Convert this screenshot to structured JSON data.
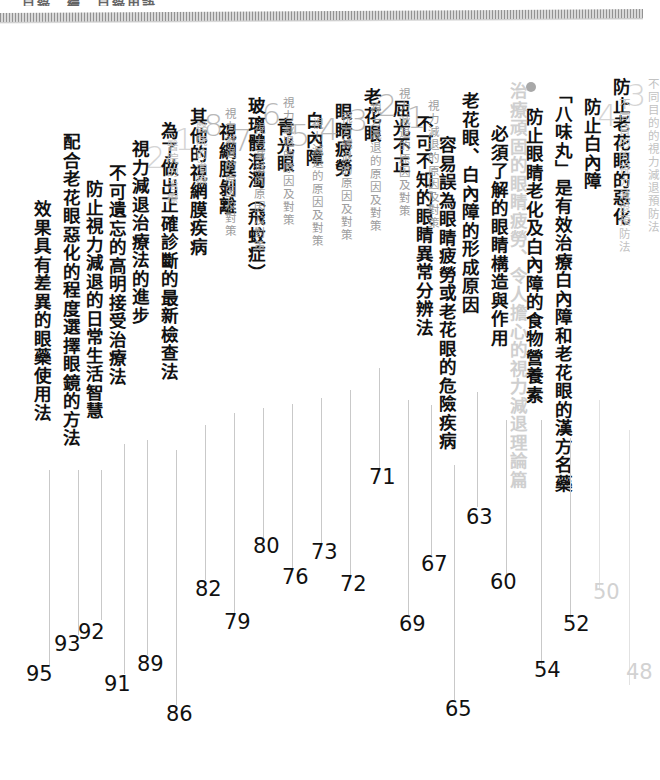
{
  "page": {
    "type": "book-table-of-contents",
    "language": "zh-Hant",
    "orientation": "vertical-rl",
    "top_cropped_text": "目錄　續　目錄用語",
    "colors": {
      "title_black": "#111111",
      "kicker_gray": "#9d9d9d",
      "number_gray": "#b9b9b9",
      "faded_gray": "#cfcfcf",
      "leader_line": "#c9c9c9"
    }
  },
  "entries": [
    {
      "id": "e01",
      "kicker": "",
      "number": "",
      "title": "效果具有差異的眼藥使用法",
      "page": "95",
      "faded": false
    },
    {
      "id": "e02",
      "kicker": "",
      "number": "",
      "title": "配合老花眼惡化的程度選擇眼鏡的方法",
      "page": "93",
      "faded": false
    },
    {
      "id": "e03",
      "kicker": "",
      "number": "",
      "title": "防止視力減退的日常生活智慧",
      "page": "92",
      "faded": false
    },
    {
      "id": "e04",
      "kicker": "",
      "number": "",
      "title": "不可遺忘的高明接受治療法",
      "page": "91",
      "faded": false
    },
    {
      "id": "e05",
      "kicker": "醫院的治療",
      "number": "2",
      "title": "視力減退治療法的進步",
      "page": "89",
      "faded": true
    },
    {
      "id": "e06",
      "kicker": "醫院的治療",
      "number": "1",
      "title": "為了做出正確診斷的最新檢查法",
      "page": "86",
      "faded": true
    },
    {
      "id": "e07",
      "kicker": "視力減退的原因及對策",
      "number": "8",
      "title": "其他的視網膜疾病",
      "page": "82",
      "faded": false
    },
    {
      "id": "e08",
      "kicker": "視力減退的原因及對策",
      "number": "7",
      "title": "視網膜剝離",
      "page": "79",
      "faded": false
    },
    {
      "id": "e09",
      "kicker": "視力減退的原因及對策",
      "number": "6",
      "title": "玻璃體混濁（飛蚊症）",
      "page": "76",
      "faded": false
    },
    {
      "id": "e10",
      "kicker": "視力減退的原因及對策",
      "number": "5",
      "title": "青光眼",
      "page": "80",
      "faded": false
    },
    {
      "id": "e11",
      "kicker": "視力減退的原因及對策",
      "number": "4",
      "title": "白內障",
      "page": "73",
      "faded": false
    },
    {
      "id": "e12",
      "kicker": "視力減退的原因及對策",
      "number": "3",
      "title": "眼睛疲勞",
      "page": "72",
      "faded": false
    },
    {
      "id": "e13",
      "kicker": "視力減退的原因及對策",
      "number": "2",
      "title": "老花眼",
      "page": "71",
      "faded": false
    },
    {
      "id": "e14",
      "kicker": "視力減退的原因及對策",
      "number": "1",
      "title": "屈光不正",
      "page": "69",
      "faded": false
    },
    {
      "id": "e15",
      "kicker": "",
      "number": "",
      "title": "不可不知的眼睛異常分辨法",
      "page": "67",
      "faded": false
    },
    {
      "id": "e16",
      "kicker": "",
      "number": "",
      "title": "容易誤為眼睛疲勞或老花眼的危險疾病",
      "page": "65",
      "faded": false
    },
    {
      "id": "e17",
      "kicker": "",
      "number": "",
      "title": "老花眼、白內障的形成原因",
      "page": "63",
      "faded": false
    },
    {
      "id": "e18",
      "kicker": "",
      "number": "",
      "title": "必須了解的眼睛構造與作用",
      "page": "60",
      "faded": false
    },
    {
      "id": "e19",
      "kicker": "",
      "number": "",
      "bullet": true,
      "title": "治療頑固的眼睛疲勞、令人擔心的視力減退理論篇",
      "page": "",
      "faded": true
    },
    {
      "id": "e20",
      "kicker": "",
      "number": "",
      "title": "防止眼睛老化及白內障的食物營養素",
      "page": "54",
      "faded": false
    },
    {
      "id": "e21",
      "kicker": "",
      "number": "",
      "title": "「八味丸」是有效治療白內障和老花眼的漢方名藥",
      "page": "52",
      "faded": false
    },
    {
      "id": "e22",
      "kicker": "不同目的的視力減退預防法",
      "number": "4",
      "title": "防止白內障",
      "page": "50",
      "faded": true
    },
    {
      "id": "e23",
      "kicker": "不同目的的視力減退預防法",
      "number": "3",
      "title": "防止老花眼的惡化",
      "page": "48",
      "faded": true
    }
  ],
  "page_numbers": [
    {
      "value": "95",
      "faded": false
    },
    {
      "value": "93",
      "faded": false
    },
    {
      "value": "92",
      "faded": false
    },
    {
      "value": "91",
      "faded": false
    },
    {
      "value": "89",
      "faded": false
    },
    {
      "value": "86",
      "faded": false
    },
    {
      "value": "82",
      "faded": false
    },
    {
      "value": "79",
      "faded": false
    },
    {
      "value": "80",
      "faded": false
    },
    {
      "value": "76",
      "faded": false
    },
    {
      "value": "73",
      "faded": false
    },
    {
      "value": "72",
      "faded": false
    },
    {
      "value": "71",
      "faded": false
    },
    {
      "value": "69",
      "faded": false
    },
    {
      "value": "67",
      "faded": false
    },
    {
      "value": "65",
      "faded": false
    },
    {
      "value": "63",
      "faded": false
    },
    {
      "value": "60",
      "faded": false
    },
    {
      "value": "54",
      "faded": false
    },
    {
      "value": "52",
      "faded": false
    },
    {
      "value": "50",
      "faded": true
    },
    {
      "value": "48",
      "faded": true
    }
  ]
}
